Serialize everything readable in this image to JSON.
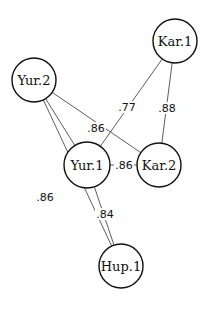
{
  "diagram": {
    "type": "network",
    "nodes": [
      {
        "id": "kar1",
        "label": "Kar.1",
        "x": 175,
        "y": 41,
        "r": 22
      },
      {
        "id": "yur2",
        "label": "Yur.2",
        "x": 34,
        "y": 80,
        "r": 22
      },
      {
        "id": "yur1",
        "label": "Yur.1",
        "x": 87,
        "y": 165,
        "r": 23
      },
      {
        "id": "kar2",
        "label": "Kar.2",
        "x": 159,
        "y": 165,
        "r": 22
      },
      {
        "id": "hup1",
        "label": "Hup.1",
        "x": 121,
        "y": 266,
        "r": 22
      }
    ],
    "edges": [
      {
        "from": "kar1",
        "to": "yur1",
        "label": ".77",
        "lx": 127,
        "ly": 107
      },
      {
        "from": "kar1",
        "to": "kar2",
        "label": ".88",
        "lx": 167,
        "ly": 108
      },
      {
        "from": "yur2",
        "to": "kar2",
        "label": ".86",
        "lx": 96,
        "ly": 128
      },
      {
        "from": "yur2",
        "to": "yur1",
        "label": "",
        "lx": 0,
        "ly": 0
      },
      {
        "from": "yur1",
        "to": "kar2",
        "label": ".86",
        "lx": 124,
        "ly": 165
      },
      {
        "from": "yur2",
        "to": "hup1",
        "label": ".86",
        "lx": 45,
        "ly": 197
      },
      {
        "from": "yur1",
        "to": "hup1",
        "label": ".84",
        "lx": 105,
        "ly": 214
      }
    ]
  }
}
